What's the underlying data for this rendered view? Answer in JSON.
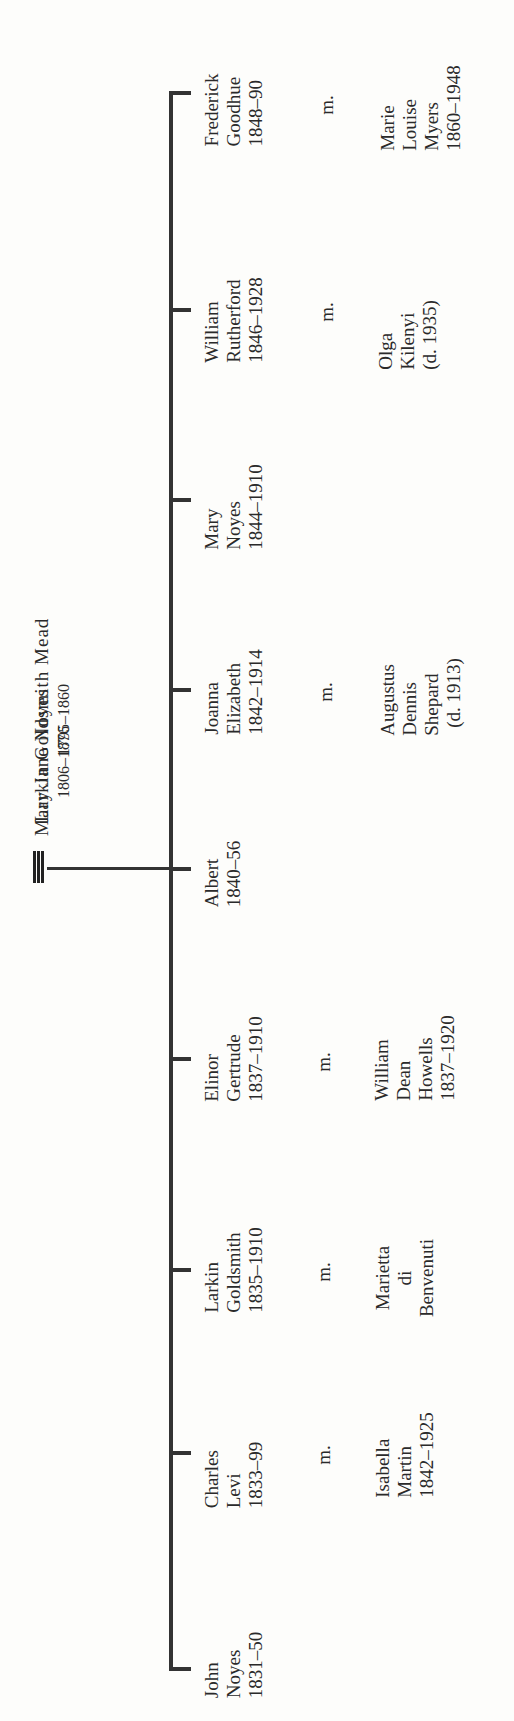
{
  "parents": {
    "father": {
      "name": "Larkin Goldsmith Mead",
      "dates": "1795–1860"
    },
    "marriage_symbol": "≡",
    "mother": {
      "name": "Mary Jane Noyes",
      "dates": "1806–1876"
    }
  },
  "marriage_label": "m.",
  "children": [
    {
      "lines": [
        "John",
        "Noyes",
        "1831–50"
      ]
    },
    {
      "lines": [
        "Charles",
        "Levi",
        "1833–99"
      ],
      "spouse": [
        "Isabella",
        "Martin",
        "1842–1925"
      ]
    },
    {
      "lines": [
        "Larkin",
        "Goldsmith",
        "1835–1910"
      ],
      "spouse": [
        "Marietta",
        "di",
        "Benvenuti"
      ]
    },
    {
      "lines": [
        "Elinor",
        "Gertrude",
        "1837–1910"
      ],
      "spouse": [
        "William",
        "Dean",
        "Howells",
        "1837–1920"
      ]
    },
    {
      "lines": [
        "Albert",
        "1840–56"
      ]
    },
    {
      "lines": [
        "Joanna",
        "Elizabeth",
        "1842–1914"
      ],
      "spouse": [
        "Augustus",
        "Dennis",
        "Shepard",
        "(d. 1913)"
      ]
    },
    {
      "lines": [
        "Mary",
        "Noyes",
        "1844–1910"
      ]
    },
    {
      "lines": [
        "William",
        "Rutherford",
        "1846–1928"
      ],
      "spouse": [
        "Olga",
        "Kilenyi",
        "(d. 1935)"
      ]
    },
    {
      "lines": [
        "Frederick",
        "Goodhue",
        "1848–90"
      ],
      "spouse": [
        "Marie",
        "Louise",
        "Myers",
        "1860–1948"
      ]
    }
  ]
}
